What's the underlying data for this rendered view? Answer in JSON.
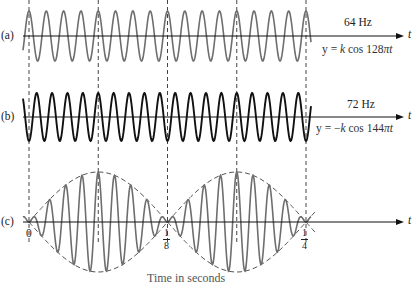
{
  "panels": [
    {
      "id": "a",
      "label": "(a)",
      "frequency_label": "64 Hz",
      "equation": "y = k cos 128πt",
      "equation_parts": {
        "lhs": "y = ",
        "k": "k",
        "fn": " cos 128",
        "pi": "π",
        "t": "t"
      },
      "frequency_hz": 64,
      "sign": 1,
      "color": "#6e6e6e",
      "axis_y": 36,
      "amplitude_px": 25
    },
    {
      "id": "b",
      "label": "(b)",
      "frequency_label": "72 Hz",
      "equation": "y = −k cos 144πt",
      "equation_parts": {
        "lhs": "y = −",
        "k": "k",
        "fn": " cos 144",
        "pi": "π",
        "t": "t"
      },
      "frequency_hz": 72,
      "sign": -1,
      "color": "#111111",
      "axis_y": 117,
      "amplitude_px": 24
    },
    {
      "id": "c",
      "label": "(c)",
      "description": "sum of (a) and (b) — beats",
      "color": "#6e6e6e",
      "envelope_color": "#555555",
      "axis_y": 222,
      "amplitude_px": 50
    }
  ],
  "axis_label": "t",
  "tick_labels": {
    "zero": "0",
    "eighth": {
      "num": "1",
      "den": "8"
    },
    "quarter": {
      "num": "1",
      "den": "4"
    }
  },
  "dashed_guides_t": [
    0,
    0.0625,
    0.125,
    0.1875,
    0.25
  ],
  "caption_partial": "Time in seconds",
  "layout": {
    "t0_x": 29,
    "px_per_second": 1108,
    "wave_start_x": 23,
    "wave_end_x": 311,
    "axis_start_x": 23,
    "axis_end_x": 404
  },
  "colors": {
    "axis": "#111111",
    "dashed": "#444444",
    "gray_wave": "#6e6e6e",
    "black_wave": "#111111"
  }
}
